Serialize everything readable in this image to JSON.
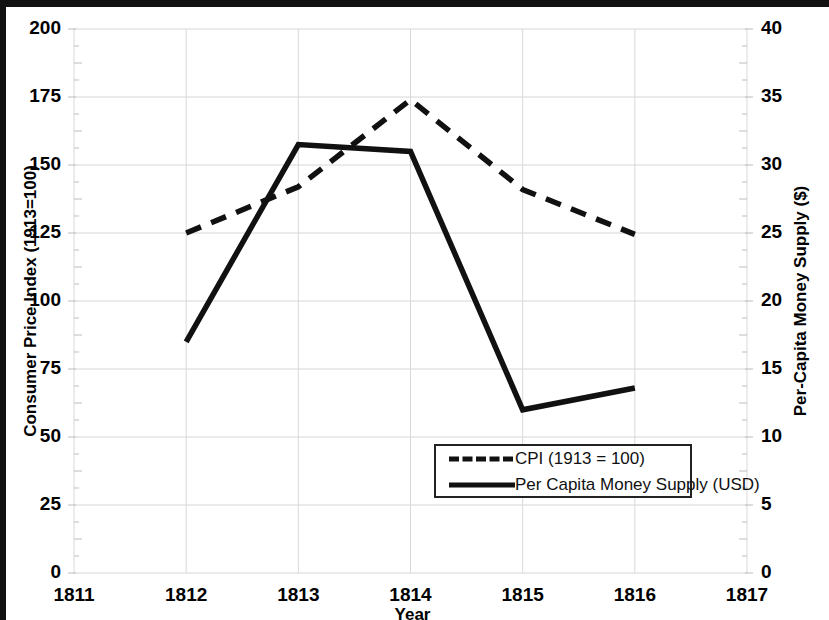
{
  "chart_data": {
    "type": "line",
    "title": "",
    "xlabel": "Year",
    "ylabel": "Consumer Price Index (1913=100)",
    "y2label": "Per-Capita Money Supply ($)",
    "x": [
      1812,
      1813,
      1814,
      1815,
      1816
    ],
    "xlim": [
      1811,
      1817
    ],
    "ylim": [
      0,
      200
    ],
    "y2lim": [
      0,
      40
    ],
    "xticks": [
      "1811",
      "1812",
      "1813",
      "1814",
      "1815",
      "1816",
      "1817"
    ],
    "yticks": [
      "0",
      "25",
      "50",
      "75",
      "100",
      "125",
      "150",
      "175",
      "200"
    ],
    "y2ticks": [
      "0",
      "5",
      "10",
      "15",
      "20",
      "25",
      "30",
      "35",
      "40"
    ],
    "grid": true,
    "legend_position": "lower-center",
    "series": [
      {
        "name": "CPI (1913 = 100)",
        "axis": "left",
        "style": "dashed",
        "color": "#111111",
        "values": [
          125,
          142,
          174,
          141,
          124.5
        ]
      },
      {
        "name": "Per Capita Money Supply (USD)",
        "axis": "right",
        "style": "solid",
        "color": "#111111",
        "values": [
          17,
          31.5,
          31,
          12,
          13.6
        ]
      }
    ]
  },
  "legend": {
    "items": [
      {
        "label": "CPI (1913 = 100)",
        "style": "dashed"
      },
      {
        "label": "Per Capita Money Supply (USD)",
        "style": "solid"
      }
    ]
  }
}
